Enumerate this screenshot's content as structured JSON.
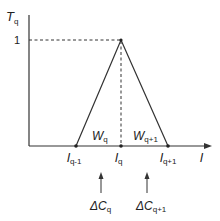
{
  "diagram": {
    "y_axis": {
      "label": "T",
      "label_sub": "q",
      "tick_label": "1"
    },
    "x_axis": {
      "label": "l"
    },
    "nodes": [
      {
        "label": "l",
        "sub": "q-1"
      },
      {
        "label": "l",
        "sub": "q"
      },
      {
        "label": "l",
        "sub": "q+1"
      }
    ],
    "regions": [
      {
        "label": "W",
        "sub": "q"
      },
      {
        "label": "W",
        "sub": "q+1"
      }
    ],
    "arrows": [
      {
        "label": "ΔC",
        "sub": "q"
      },
      {
        "label": "ΔC",
        "sub": "q+1"
      }
    ],
    "colors": {
      "line": "#333333",
      "background": "#ffffff"
    }
  }
}
